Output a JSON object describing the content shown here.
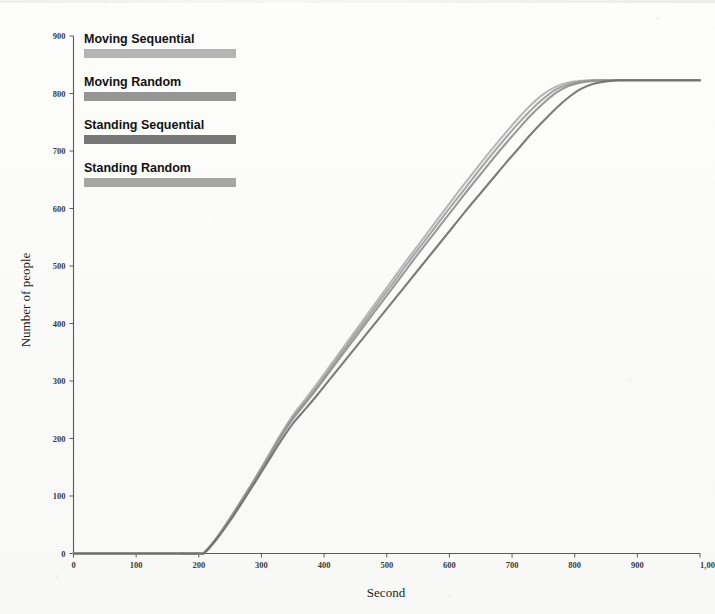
{
  "chart_data": {
    "type": "line",
    "title": "",
    "xlabel": "Second",
    "ylabel": "Number of people",
    "xlim": [
      0,
      1000
    ],
    "ylim": [
      0,
      900
    ],
    "grid": false,
    "legend_position": "top-left",
    "x_ticks": [
      "0",
      "100",
      "200",
      "300",
      "400",
      "500",
      "600",
      "700",
      "800",
      "900",
      "1,000"
    ],
    "x_tick_values": [
      0,
      100,
      200,
      300,
      400,
      500,
      600,
      700,
      800,
      900,
      1000
    ],
    "y_ticks": [
      "0",
      "100",
      "200",
      "300",
      "400",
      "500",
      "600",
      "700",
      "800",
      "900"
    ],
    "y_tick_values": [
      0,
      100,
      200,
      300,
      400,
      500,
      600,
      700,
      800,
      900
    ],
    "x_last_label_clipped": "1,00",
    "x": [
      0,
      50,
      100,
      150,
      200,
      210,
      230,
      250,
      270,
      290,
      310,
      330,
      350,
      370,
      390,
      410,
      430,
      450,
      470,
      490,
      510,
      530,
      550,
      570,
      590,
      610,
      630,
      650,
      670,
      690,
      710,
      730,
      750,
      770,
      790,
      810,
      830,
      850,
      870,
      890,
      910,
      930,
      950,
      970,
      1000
    ],
    "series": [
      {
        "name": "Moving Sequential",
        "color": "#b0b0b0",
        "values": [
          0,
          0,
          0,
          0,
          0,
          3,
          30,
          62,
          96,
          131,
          168,
          206,
          240,
          268,
          297,
          327,
          357,
          387,
          417,
          447,
          477,
          507,
          536,
          565,
          594,
          623,
          651,
          679,
          706,
          732,
          757,
          780,
          799,
          812,
          819,
          822,
          823,
          823,
          823,
          823,
          823,
          823,
          823,
          823,
          823
        ]
      },
      {
        "name": "Moving Random",
        "color": "#909090",
        "values": [
          0,
          0,
          0,
          0,
          0,
          3,
          29,
          60,
          94,
          128,
          164,
          201,
          234,
          261,
          289,
          318,
          347,
          376,
          405,
          434,
          463,
          492,
          521,
          549,
          577,
          605,
          633,
          660,
          687,
          713,
          738,
          762,
          783,
          801,
          813,
          819,
          822,
          823,
          823,
          823,
          823,
          823,
          823,
          823,
          823
        ]
      },
      {
        "name": "Standing Sequential",
        "color": "#707070",
        "values": [
          0,
          0,
          0,
          0,
          0,
          2,
          27,
          57,
          90,
          124,
          159,
          194,
          226,
          251,
          277,
          304,
          331,
          358,
          385,
          412,
          439,
          466,
          493,
          520,
          547,
          574,
          601,
          627,
          653,
          679,
          704,
          729,
          752,
          774,
          793,
          808,
          817,
          821,
          823,
          823,
          823,
          823,
          823,
          823,
          823
        ]
      },
      {
        "name": "Standing Random",
        "color": "#a0a0a0",
        "values": [
          0,
          0,
          0,
          0,
          0,
          3,
          29,
          61,
          95,
          130,
          166,
          203,
          237,
          264,
          292,
          322,
          352,
          382,
          411,
          441,
          470,
          500,
          529,
          557,
          586,
          614,
          642,
          670,
          697,
          723,
          748,
          771,
          791,
          807,
          816,
          821,
          823,
          823,
          823,
          823,
          823,
          823,
          823,
          823,
          823
        ]
      }
    ],
    "notes": {
      "onset_second": 205,
      "plateau_value": 823,
      "plateau_second": 920
    }
  },
  "legend": {
    "items": [
      {
        "label": "Moving Sequential",
        "color": "#b0b0b0"
      },
      {
        "label": "Moving Random",
        "color": "#909090"
      },
      {
        "label": "Standing Sequential",
        "color": "#707070"
      },
      {
        "label": "Standing Random",
        "color": "#a0a0a0"
      }
    ]
  },
  "axes": {
    "x_title": "Second",
    "y_title": "Number of people"
  }
}
